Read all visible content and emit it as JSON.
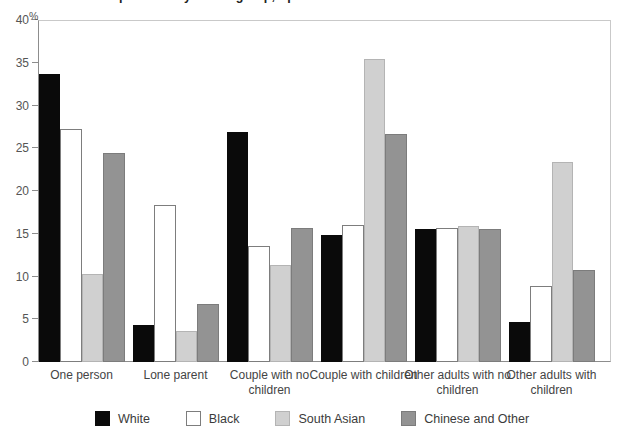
{
  "chart_data": {
    "type": "bar",
    "title": "Household composition: by ethnic group, April 2001",
    "xlabel": "",
    "ylabel": "%",
    "ylim": [
      0,
      40
    ],
    "yticks": [
      0,
      5,
      10,
      15,
      20,
      25,
      30,
      35,
      40
    ],
    "grid": false,
    "legend_position": "bottom",
    "categories": [
      "One person",
      "Lone parent",
      "Couple with no children",
      "Couple with children",
      "Other adults with no children",
      "Other adults with children"
    ],
    "series": [
      {
        "name": "White",
        "color": "#0a0a0a",
        "values": [
          33.7,
          4.3,
          26.9,
          14.9,
          15.6,
          4.7
        ]
      },
      {
        "name": "Black",
        "color": "#ffffff",
        "values": [
          27.3,
          18.4,
          13.6,
          16.0,
          15.7,
          8.9
        ]
      },
      {
        "name": "South Asian",
        "color": "#d0d0d0",
        "values": [
          10.3,
          3.6,
          11.3,
          35.4,
          15.9,
          23.4
        ]
      },
      {
        "name": "Chinese and Other",
        "color": "#939393",
        "values": [
          24.5,
          6.8,
          15.7,
          26.7,
          15.5,
          10.8
        ]
      }
    ]
  },
  "axis": {
    "unit_symbol": "%"
  }
}
